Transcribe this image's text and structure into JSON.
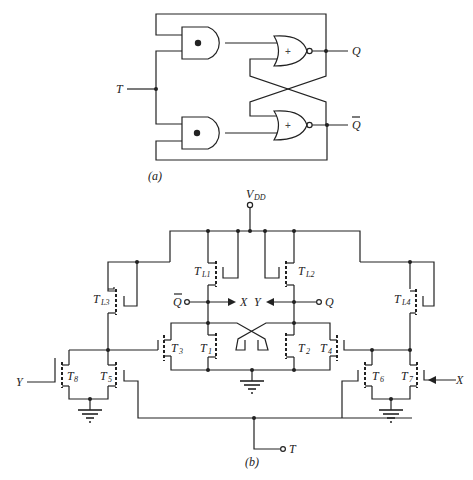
{
  "figure_a": {
    "caption": "(a)",
    "input_label": "T",
    "output_q": "Q",
    "output_qbar": "Q",
    "and_gate_symbol": "•",
    "nor_gate_symbol": "+"
  },
  "figure_b": {
    "caption": "(b)",
    "supply_label": "V",
    "supply_sub": "DD",
    "node_qbar": "Q",
    "node_q": "Q",
    "out_x": "X",
    "out_y": "Y",
    "input_y": "Y",
    "input_x": "X",
    "input_t": "T",
    "transistors": {
      "TL1": {
        "main": "T",
        "sub": "L1"
      },
      "TL2": {
        "main": "T",
        "sub": "L2"
      },
      "TL3": {
        "main": "T",
        "sub": "L3"
      },
      "TL4": {
        "main": "T",
        "sub": "L4"
      },
      "T1": {
        "main": "T",
        "sub": "1"
      },
      "T2": {
        "main": "T",
        "sub": "2"
      },
      "T3": {
        "main": "T",
        "sub": "3"
      },
      "T4": {
        "main": "T",
        "sub": "4"
      },
      "T5": {
        "main": "T",
        "sub": "5"
      },
      "T6": {
        "main": "T",
        "sub": "6"
      },
      "T7": {
        "main": "T",
        "sub": "7"
      },
      "T8": {
        "main": "T",
        "sub": "8"
      }
    }
  }
}
